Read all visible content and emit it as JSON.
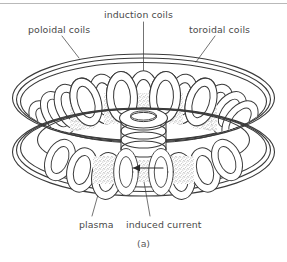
{
  "figure": {
    "caption": "(a)",
    "line_color": "#3a3a3a",
    "stipple_color": "#6b6b6b",
    "label_color": "#4a4a4a",
    "background": "#ffffff",
    "rule_color": "#b9b9b9"
  },
  "labels": {
    "poloidal": "poloidal coils",
    "induction": "induction coils",
    "toroidal": "toroidal coils",
    "plasma": "plasma",
    "induced_current": "induced current"
  },
  "annotations": {
    "current_arrow_direction": "left"
  }
}
